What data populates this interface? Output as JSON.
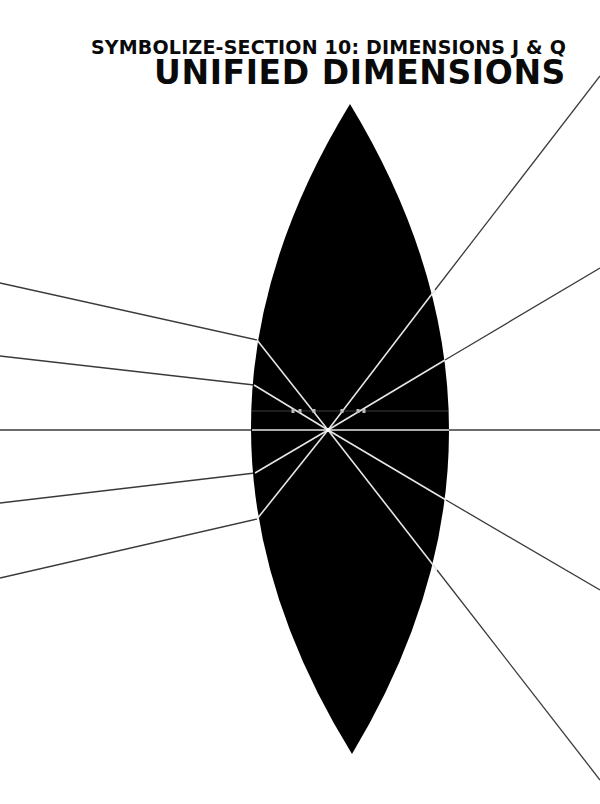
{
  "header": {
    "subtitle": "SYMBOLIZE-SECTION 10: DIMENSIONS J & Q",
    "title": "UNIFIED DIMENSIONS"
  },
  "diagram": {
    "type": "convex-lens-ray-diagram",
    "colors": {
      "background": "#ffffff",
      "lens_fill": "#000000",
      "ray_outside": "#3a3a3a",
      "ray_inside": "#e6e6e6",
      "axis_faint": "#3c3c3c",
      "tick_marks": "#bdbdbd"
    },
    "lens": {
      "top_tip": [
        350,
        104
      ],
      "bottom_tip": [
        352,
        754
      ],
      "left_extent_x": 251,
      "right_extent_x": 449
    },
    "focal_point": [
      328,
      430
    ],
    "incoming_rays": [
      {
        "start": [
          0,
          283
        ],
        "enter": [
          257,
          340
        ]
      },
      {
        "start": [
          0,
          356
        ],
        "enter": [
          254,
          385
        ]
      },
      {
        "start": [
          0,
          430
        ],
        "enter": [
          252,
          430
        ]
      },
      {
        "start": [
          0,
          503
        ],
        "enter": [
          255,
          473
        ]
      },
      {
        "start": [
          0,
          578
        ],
        "enter": [
          257,
          519
        ]
      }
    ],
    "outgoing_rays": [
      {
        "exit": [
          435,
          290
        ],
        "end": [
          600,
          76
        ]
      },
      {
        "exit": [
          445,
          360
        ],
        "end": [
          600,
          268
        ]
      },
      {
        "exit": [
          449,
          430
        ],
        "end": [
          600,
          430
        ]
      },
      {
        "exit": [
          446,
          500
        ],
        "end": [
          600,
          590
        ]
      },
      {
        "exit": [
          437,
          570
        ],
        "end": [
          600,
          780
        ]
      }
    ],
    "faint_axis_y": 411,
    "tick_marks_x": [
      293,
      300,
      314,
      342,
      358,
      364
    ]
  }
}
